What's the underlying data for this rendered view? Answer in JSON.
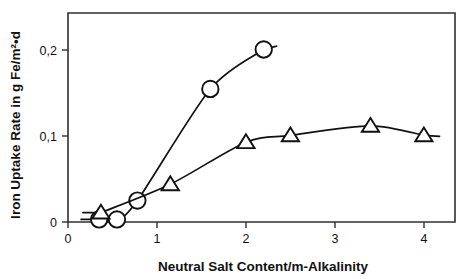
{
  "chart_data": {
    "type": "scatter",
    "title": "",
    "xlabel": "Neutral Salt Content/m-Alkalinity",
    "ylabel": "Iron Uptake Rate in g Fe/m²•d",
    "xlim": [
      0,
      4.35
    ],
    "ylim": [
      0,
      0.2435
    ],
    "xticks": [
      0,
      1,
      2,
      3,
      4
    ],
    "xtick_labels": [
      "0",
      "1",
      "2",
      "3",
      "4"
    ],
    "yticks": [
      0,
      0.1,
      0.2
    ],
    "ytick_labels": [
      "0",
      "0,1",
      "0,2"
    ],
    "grid": false,
    "legend": "none",
    "frame": "box",
    "series": [
      {
        "name": "circles",
        "marker": "circle",
        "color": "#111111",
        "points": [
          {
            "x": 0.35,
            "y": 0.003
          },
          {
            "x": 0.55,
            "y": 0.003
          },
          {
            "x": 0.78,
            "y": 0.025
          },
          {
            "x": 1.6,
            "y": 0.155
          },
          {
            "x": 2.2,
            "y": 0.201
          }
        ]
      },
      {
        "name": "triangles",
        "marker": "triangle",
        "color": "#111111",
        "points": [
          {
            "x": 0.37,
            "y": 0.011
          },
          {
            "x": 1.15,
            "y": 0.044
          },
          {
            "x": 2.0,
            "y": 0.093
          },
          {
            "x": 2.5,
            "y": 0.101
          },
          {
            "x": 3.4,
            "y": 0.112
          },
          {
            "x": 4.0,
            "y": 0.101
          }
        ]
      }
    ]
  },
  "axes": {
    "x_label": "Neutral Salt Content/m-Alkalinity",
    "y_label": "Iron Uptake Rate in g Fe/m²•d",
    "x_tick_0": "0",
    "x_tick_1": "1",
    "x_tick_2": "2",
    "x_tick_3": "3",
    "x_tick_4": "4",
    "y_tick_0": "0",
    "y_tick_1": "0,1",
    "y_tick_2": "0,2"
  }
}
